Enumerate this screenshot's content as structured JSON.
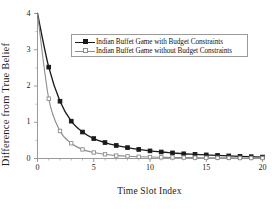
{
  "chart_data": {
    "type": "line",
    "title": "",
    "xlabel": "Time Slot Index",
    "ylabel": "Difference from True Belief",
    "xlim": [
      0,
      20
    ],
    "ylim": [
      0,
      4
    ],
    "xticks": [
      "0",
      "5",
      "10",
      "15",
      "20"
    ],
    "xtick_values": [
      0,
      5,
      10,
      15,
      20
    ],
    "yticks": [
      "0",
      "1",
      "2",
      "3",
      "4"
    ],
    "ytick_values": [
      0,
      1,
      2,
      3,
      4
    ],
    "grid": false,
    "legend_position": "upper center",
    "x": [
      0,
      1,
      2,
      3,
      4,
      5,
      6,
      7,
      8,
      9,
      10,
      11,
      12,
      13,
      14,
      15,
      16,
      17,
      18,
      19,
      20
    ],
    "series": [
      {
        "name": "Indian Buffet Game with Budget Constraints",
        "color": "#1a1a1a",
        "marker": "filled-square",
        "values": [
          4.0,
          2.52,
          1.58,
          1.03,
          0.73,
          0.55,
          0.44,
          0.36,
          0.3,
          0.25,
          0.21,
          0.18,
          0.155,
          0.13,
          0.115,
          0.1,
          0.085,
          0.072,
          0.06,
          0.05,
          0.04
        ]
      },
      {
        "name": "Indian Buffet Game without Budget Constraints",
        "color": "#8c8c8c",
        "marker": "open-square",
        "values": [
          4.0,
          1.65,
          0.76,
          0.42,
          0.25,
          0.165,
          0.115,
          0.08,
          0.06,
          0.048,
          0.04,
          0.034,
          0.029,
          0.026,
          0.023,
          0.021,
          0.019,
          0.017,
          0.015,
          0.014,
          0.013
        ]
      }
    ]
  },
  "legend": {
    "entries": [
      {
        "label": "Indian Buffet Game with Budget Constraints"
      },
      {
        "label": "Indian Buffet Game without Budget Constraints"
      }
    ]
  },
  "colors": {
    "series_with_budget": "#1a1a1a",
    "series_without_budget": "#8c8c8c",
    "axis": "#9a9a9a",
    "text": "#1a1a1a",
    "background": "#ffffff"
  }
}
